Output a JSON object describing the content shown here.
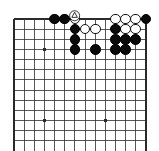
{
  "figure": {
    "kind": "go-board-diagram",
    "game": "Go",
    "background_color": "#ffffff",
    "line_color": "#3a3a3a",
    "border_color": "#2a2a2a",
    "black_stone_color": "#0a0a0a",
    "white_stone_color": "#ffffff",
    "white_stone_border": "#111111"
  },
  "board": {
    "origin_x": 14,
    "origin_y": 19,
    "spacing": 10.15,
    "cols": 14,
    "rows": 13,
    "left_edge_heavy": true,
    "top_edge_heavy": true,
    "right_edge_heavy": true,
    "bottom_open": true,
    "star_points": [
      {
        "col": 4,
        "row": 4
      },
      {
        "col": 4,
        "row": 11
      },
      {
        "col": 10,
        "row": 11
      }
    ]
  },
  "stones": [
    {
      "color": "black",
      "col": 5,
      "row": 1
    },
    {
      "color": "black",
      "col": 6,
      "row": 1
    },
    {
      "color": "white",
      "col": 7,
      "row": 1,
      "mark": "triangle"
    },
    {
      "color": "white",
      "col": 11,
      "row": 1
    },
    {
      "color": "white",
      "col": 12,
      "row": 1
    },
    {
      "color": "white",
      "col": 13,
      "row": 1
    },
    {
      "color": "black",
      "col": 14,
      "row": 1
    },
    {
      "color": "black",
      "col": 7,
      "row": 2
    },
    {
      "color": "white",
      "col": 8,
      "row": 2
    },
    {
      "color": "white",
      "col": 9,
      "row": 2
    },
    {
      "color": "black",
      "col": 11,
      "row": 2
    },
    {
      "color": "white",
      "col": 12,
      "row": 2
    },
    {
      "color": "white",
      "col": 13,
      "row": 2
    },
    {
      "color": "black",
      "col": 7,
      "row": 3
    },
    {
      "color": "black",
      "col": 11,
      "row": 3
    },
    {
      "color": "black",
      "col": 12,
      "row": 3
    },
    {
      "color": "black",
      "col": 13,
      "row": 3
    },
    {
      "color": "black",
      "col": 7,
      "row": 4
    },
    {
      "color": "black",
      "col": 9,
      "row": 4
    },
    {
      "color": "black",
      "col": 11,
      "row": 4
    },
    {
      "color": "black",
      "col": 12,
      "row": 4
    }
  ],
  "markers": [
    {
      "type": "triangle",
      "col": 7,
      "row": 1,
      "label": "triangle-marked-white-stone"
    }
  ]
}
